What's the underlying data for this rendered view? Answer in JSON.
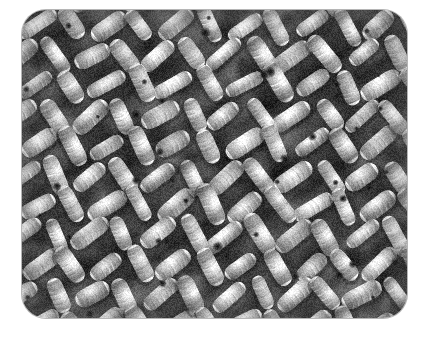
{
  "image": {
    "kind": "photograph",
    "subject": "knitted fabric texture close-up",
    "description": "Macro close-up photograph of thick white chunky-knit crochet fabric showing diagonal rows of plump yarn stitches",
    "alt_text": "White knitted wool fabric texture",
    "canvas": {
      "width": 429,
      "height": 338
    },
    "background_color": "#ffffff",
    "panel": {
      "x": 22,
      "y": 10,
      "width": 385,
      "height": 308,
      "corner_radius": 24,
      "border_color": "#787878"
    },
    "palette": {
      "yarn_highlight": "#ffffff",
      "yarn_light": "#f4f4f4",
      "yarn_mid": "#dcdcdc",
      "yarn_shade": "#b4b4b4",
      "gap_shadow": "#6e6e6e",
      "gap_dark": "#2a2a2a",
      "gap_deepest": "#101010"
    },
    "texture": {
      "stitch_type": "moss / seed stitch",
      "yarn_weight": "chunky",
      "row_angle_degrees": 35,
      "stitch_columns": 13,
      "stitch_rows": 11,
      "stitch_width_px": 34,
      "stitch_height_px": 30,
      "ply_lines_per_stitch": 6,
      "noise_amount": 0.16,
      "random_seed": 20240517
    }
  }
}
